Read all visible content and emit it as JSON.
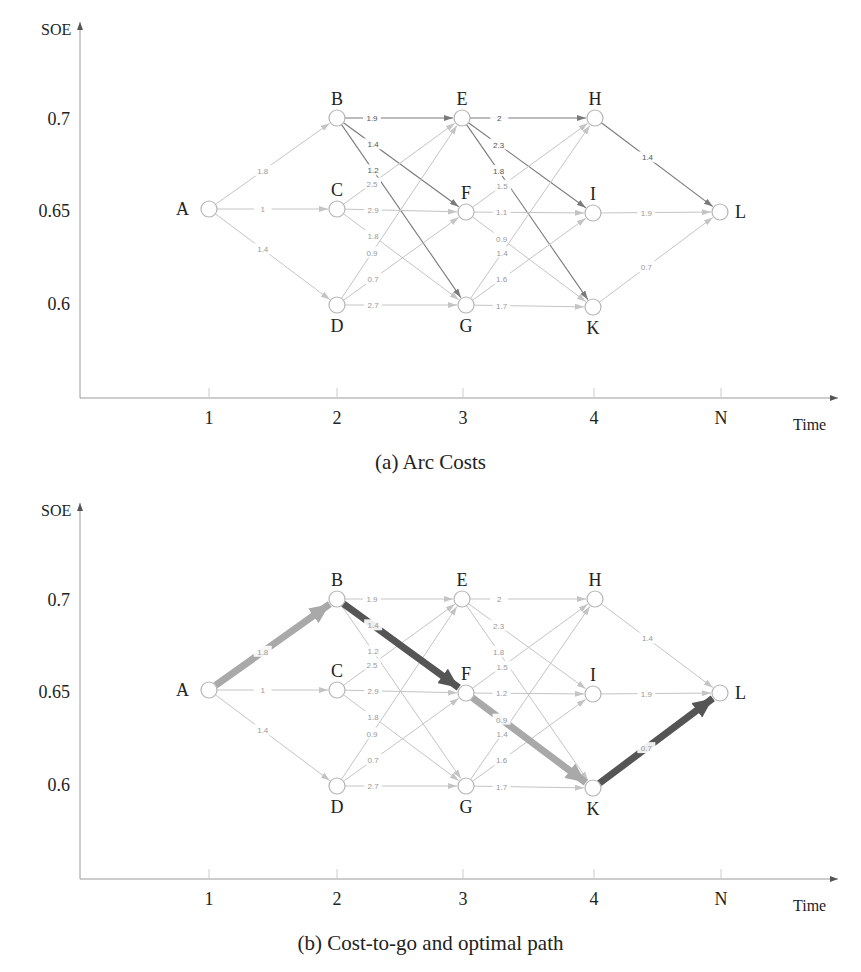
{
  "panels": [
    {
      "id": "a",
      "caption": "(a) Arc Costs",
      "y_axis_label": "SOE",
      "x_axis_label": "Time",
      "y_ticks": [
        "0.7",
        "0.65",
        "0.6"
      ],
      "x_ticks": [
        "1",
        "2",
        "3",
        "4",
        "N"
      ]
    },
    {
      "id": "b",
      "caption": "(b) Cost-to-go and optimal path",
      "y_axis_label": "SOE",
      "x_axis_label": "Time",
      "y_ticks": [
        "0.7",
        "0.65",
        "0.6"
      ],
      "x_ticks": [
        "1",
        "2",
        "3",
        "4",
        "N"
      ]
    }
  ],
  "nodes": [
    {
      "id": "A",
      "stage": "1",
      "soe": "0.65",
      "x": 209,
      "y": 209,
      "label_pos": "left"
    },
    {
      "id": "B",
      "stage": "2",
      "soe": "0.7",
      "x": 337,
      "y": 118,
      "label_pos": "top"
    },
    {
      "id": "C",
      "stage": "2",
      "soe": "0.65",
      "x": 337,
      "y": 209,
      "label_pos": "top"
    },
    {
      "id": "D",
      "stage": "2",
      "soe": "0.6",
      "x": 337,
      "y": 305,
      "label_pos": "bottom"
    },
    {
      "id": "E",
      "stage": "3",
      "soe": "0.7",
      "x": 462,
      "y": 118,
      "label_pos": "top"
    },
    {
      "id": "F",
      "stage": "3",
      "soe": "0.65",
      "x": 466,
      "y": 212,
      "label_pos": "top"
    },
    {
      "id": "G",
      "stage": "3",
      "soe": "0.6",
      "x": 466,
      "y": 305,
      "label_pos": "bottom"
    },
    {
      "id": "H",
      "stage": "4",
      "soe": "0.7",
      "x": 595,
      "y": 118,
      "label_pos": "top"
    },
    {
      "id": "I",
      "stage": "4",
      "soe": "0.65",
      "x": 593,
      "y": 213,
      "label_pos": "top"
    },
    {
      "id": "K",
      "stage": "4",
      "soe": "0.6",
      "x": 593,
      "y": 307,
      "label_pos": "bottom"
    },
    {
      "id": "L",
      "stage": "N",
      "soe": "0.65",
      "x": 720,
      "y": 212,
      "label_pos": "right"
    }
  ],
  "edges_a": [
    {
      "from": "A",
      "to": "B",
      "cost": "1.8",
      "shade": "light"
    },
    {
      "from": "A",
      "to": "C",
      "cost": "1",
      "shade": "light"
    },
    {
      "from": "A",
      "to": "D",
      "cost": "1.4",
      "shade": "light"
    },
    {
      "from": "B",
      "to": "E",
      "cost": "1.9",
      "shade": "dark"
    },
    {
      "from": "B",
      "to": "F",
      "cost": "1.4",
      "shade": "dark"
    },
    {
      "from": "B",
      "to": "G",
      "cost": "1.2",
      "shade": "dark"
    },
    {
      "from": "C",
      "to": "E",
      "cost": "2.5",
      "shade": "light"
    },
    {
      "from": "C",
      "to": "F",
      "cost": "2.9",
      "shade": "light"
    },
    {
      "from": "C",
      "to": "G",
      "cost": "1.8",
      "shade": "light"
    },
    {
      "from": "D",
      "to": "E",
      "cost": "0.9",
      "shade": "light"
    },
    {
      "from": "D",
      "to": "F",
      "cost": "0.7",
      "shade": "light"
    },
    {
      "from": "D",
      "to": "G",
      "cost": "2.7",
      "shade": "light"
    },
    {
      "from": "E",
      "to": "H",
      "cost": "2",
      "shade": "dark"
    },
    {
      "from": "E",
      "to": "I",
      "cost": "2.3",
      "shade": "dark"
    },
    {
      "from": "E",
      "to": "K",
      "cost": "1.8",
      "shade": "dark"
    },
    {
      "from": "F",
      "to": "H",
      "cost": "1.5",
      "shade": "light"
    },
    {
      "from": "F",
      "to": "I",
      "cost": "1.1",
      "shade": "light"
    },
    {
      "from": "F",
      "to": "K",
      "cost": "0.9",
      "shade": "light"
    },
    {
      "from": "G",
      "to": "H",
      "cost": "1.4",
      "shade": "light"
    },
    {
      "from": "G",
      "to": "I",
      "cost": "1.6",
      "shade": "light"
    },
    {
      "from": "G",
      "to": "K",
      "cost": "1.7",
      "shade": "light"
    },
    {
      "from": "H",
      "to": "L",
      "cost": "1.4",
      "shade": "dark"
    },
    {
      "from": "I",
      "to": "L",
      "cost": "1.9",
      "shade": "light"
    },
    {
      "from": "K",
      "to": "L",
      "cost": "0.7",
      "shade": "light"
    }
  ],
  "edges_b": [
    {
      "from": "A",
      "to": "B",
      "cost": "1.8",
      "shade": "path-light"
    },
    {
      "from": "A",
      "to": "C",
      "cost": "1",
      "shade": "light"
    },
    {
      "from": "A",
      "to": "D",
      "cost": "1.4",
      "shade": "light"
    },
    {
      "from": "B",
      "to": "E",
      "cost": "1.9",
      "shade": "light"
    },
    {
      "from": "B",
      "to": "F",
      "cost": "1.4",
      "shade": "path-dark"
    },
    {
      "from": "B",
      "to": "G",
      "cost": "1.2",
      "shade": "light"
    },
    {
      "from": "C",
      "to": "E",
      "cost": "2.5",
      "shade": "light"
    },
    {
      "from": "C",
      "to": "F",
      "cost": "2.9",
      "shade": "light"
    },
    {
      "from": "C",
      "to": "G",
      "cost": "1.8",
      "shade": "light"
    },
    {
      "from": "D",
      "to": "E",
      "cost": "0.9",
      "shade": "light"
    },
    {
      "from": "D",
      "to": "F",
      "cost": "0.7",
      "shade": "light"
    },
    {
      "from": "D",
      "to": "G",
      "cost": "2.7",
      "shade": "light"
    },
    {
      "from": "E",
      "to": "H",
      "cost": "2",
      "shade": "light"
    },
    {
      "from": "E",
      "to": "I",
      "cost": "2.3",
      "shade": "light"
    },
    {
      "from": "E",
      "to": "K",
      "cost": "1.8",
      "shade": "light"
    },
    {
      "from": "F",
      "to": "H",
      "cost": "1.5",
      "shade": "light"
    },
    {
      "from": "F",
      "to": "I",
      "cost": "1.2",
      "shade": "light"
    },
    {
      "from": "F",
      "to": "K",
      "cost": "0.9",
      "shade": "path-light"
    },
    {
      "from": "G",
      "to": "H",
      "cost": "1.4",
      "shade": "light"
    },
    {
      "from": "G",
      "to": "I",
      "cost": "1.6",
      "shade": "light"
    },
    {
      "from": "G",
      "to": "K",
      "cost": "1.7",
      "shade": "light"
    },
    {
      "from": "H",
      "to": "L",
      "cost": "1.4",
      "shade": "light"
    },
    {
      "from": "I",
      "to": "L",
      "cost": "1.9",
      "shade": "light"
    },
    {
      "from": "K",
      "to": "L",
      "cost": "0.7",
      "shade": "path-dark"
    }
  ],
  "optimal_path": [
    "A",
    "B",
    "F",
    "K",
    "L"
  ],
  "colors": {
    "edge_light": "#c4c4c4",
    "edge_dark": "#7a7a7a",
    "path_light": "#a9a9a9",
    "path_dark": "#555555",
    "label_light": "#9a9a9a",
    "label_dark": "#555555",
    "axis": "#9a9a9a",
    "node_stroke": "#b5b5b5"
  }
}
